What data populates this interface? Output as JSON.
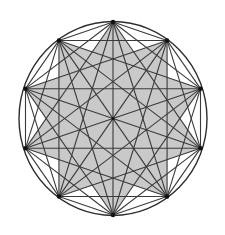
{
  "figure": {
    "vertex_count": 10,
    "star_step": 3,
    "center": [
      113,
      118.5
    ],
    "radius_x": 92,
    "radius_y": 96.5,
    "colors": {
      "background": "#ffffff",
      "shade": "#c9c9c9",
      "line": "#3a3a3a",
      "circle": "#2e2e2e",
      "vertex": "#111111"
    }
  }
}
